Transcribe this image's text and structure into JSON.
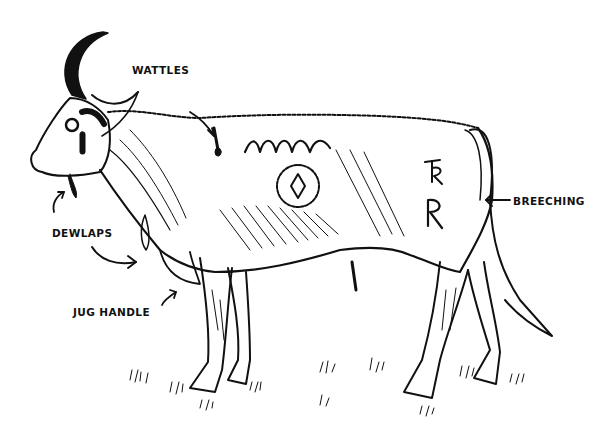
{
  "diagram": {
    "style": "black ink line drawing on white",
    "colors": {
      "background": "#ffffff",
      "ink": "#111111"
    },
    "labels": [
      {
        "id": "wattles",
        "text": "WATTLES",
        "x": 132,
        "y": 64
      },
      {
        "id": "dewlaps",
        "text": "DEWLAPS",
        "x": 52,
        "y": 227
      },
      {
        "id": "jug_handle",
        "text": "JUG HANDLE",
        "x": 73,
        "y": 306
      },
      {
        "id": "breeching",
        "text": "BREECHING",
        "x": 513,
        "y": 195
      }
    ],
    "brands": {
      "side_symbol": "circle with diamond",
      "hip_marks": [
        "TR",
        "R"
      ]
    }
  }
}
